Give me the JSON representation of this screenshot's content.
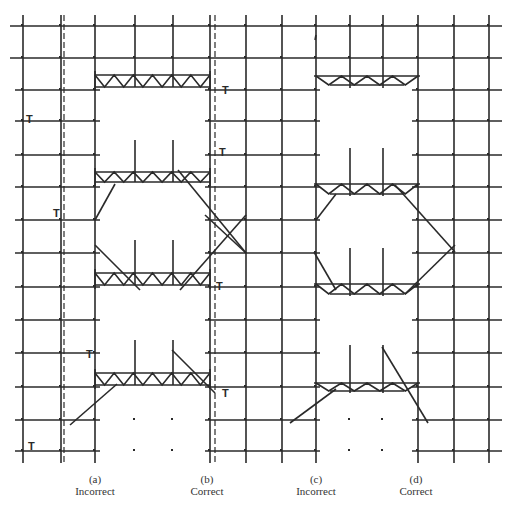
{
  "figure": {
    "line_color": "#2a2a2a",
    "background": "#ffffff"
  },
  "panels": [
    {
      "id": "a",
      "letter": "(a)",
      "verdict": "Incorrect"
    },
    {
      "id": "b",
      "letter": "(b)",
      "verdict": "Correct"
    },
    {
      "id": "c",
      "letter": "(c)",
      "verdict": "Incorrect"
    },
    {
      "id": "d",
      "letter": "(d)",
      "verdict": "Correct"
    }
  ],
  "markers": {
    "tie_symbol": "T"
  }
}
